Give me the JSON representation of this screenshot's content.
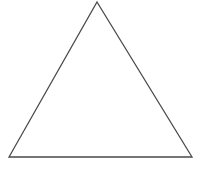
{
  "figure": {
    "name": "triangle-figure",
    "shape_type": "triangle",
    "background_color": "#ffffff",
    "stroke_color": "#4a4a4a",
    "fill_color": "#ffffff",
    "stroke_width": 1.3,
    "canvas": {
      "width": 205,
      "height": 178
    },
    "vertices": [
      {
        "label": "apex",
        "x": 97,
        "y": 2
      },
      {
        "label": "bottom-right",
        "x": 192,
        "y": 157
      },
      {
        "label": "bottom-left",
        "x": 9,
        "y": 157
      }
    ],
    "points_attr": "97,2 192,157 9,157",
    "base_width": 183,
    "height_px": 155,
    "caption": ""
  }
}
